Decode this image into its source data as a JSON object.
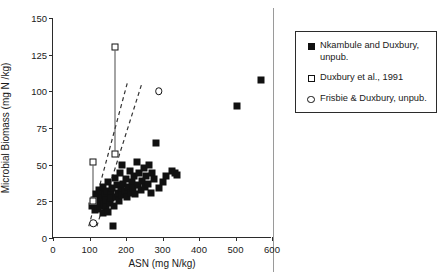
{
  "chart_data": {
    "type": "scatter",
    "title": "",
    "xlabel": "ASN (mg N/kg)",
    "ylabel": "Microbial Biomass (mg N /kg)",
    "xlim": [
      0,
      600
    ],
    "ylim": [
      0,
      150
    ],
    "xticks": [
      0,
      100,
      200,
      300,
      400,
      500,
      600
    ],
    "yticks": [
      0,
      25,
      50,
      75,
      100,
      125,
      150
    ],
    "grid": false,
    "legend_position": "right-outside",
    "series": [
      {
        "name": "Nkambule and Duxbury, unpub.",
        "marker": "filled-square",
        "color": "#111111",
        "points": [
          [
            108,
            22
          ],
          [
            112,
            26
          ],
          [
            115,
            19
          ],
          [
            118,
            30
          ],
          [
            120,
            24
          ],
          [
            122,
            28
          ],
          [
            124,
            20
          ],
          [
            126,
            33
          ],
          [
            128,
            25
          ],
          [
            130,
            22
          ],
          [
            132,
            31
          ],
          [
            134,
            27
          ],
          [
            136,
            17
          ],
          [
            138,
            35
          ],
          [
            140,
            23
          ],
          [
            142,
            29
          ],
          [
            144,
            21
          ],
          [
            146,
            26
          ],
          [
            148,
            32
          ],
          [
            150,
            18
          ],
          [
            152,
            38
          ],
          [
            155,
            24
          ],
          [
            158,
            30
          ],
          [
            160,
            27
          ],
          [
            163,
            34
          ],
          [
            165,
            8
          ],
          [
            168,
            22
          ],
          [
            170,
            41
          ],
          [
            172,
            28
          ],
          [
            175,
            36
          ],
          [
            178,
            31
          ],
          [
            180,
            25
          ],
          [
            183,
            44
          ],
          [
            186,
            33
          ],
          [
            188,
            29
          ],
          [
            190,
            50
          ],
          [
            193,
            37
          ],
          [
            196,
            32
          ],
          [
            200,
            40
          ],
          [
            203,
            28
          ],
          [
            206,
            35
          ],
          [
            210,
            46
          ],
          [
            213,
            31
          ],
          [
            216,
            38
          ],
          [
            220,
            34
          ],
          [
            223,
            42
          ],
          [
            226,
            30
          ],
          [
            230,
            52
          ],
          [
            233,
            36
          ],
          [
            236,
            44
          ],
          [
            240,
            33
          ],
          [
            244,
            39
          ],
          [
            248,
            48
          ],
          [
            252,
            35
          ],
          [
            256,
            42
          ],
          [
            260,
            37
          ],
          [
            264,
            50
          ],
          [
            268,
            31
          ],
          [
            272,
            44
          ],
          [
            276,
            40
          ],
          [
            282,
            65
          ],
          [
            290,
            34
          ],
          [
            300,
            38
          ],
          [
            310,
            42
          ],
          [
            325,
            46
          ],
          [
            335,
            44
          ],
          [
            340,
            43
          ],
          [
            505,
            90
          ],
          [
            570,
            108
          ]
        ]
      },
      {
        "name": "Duxbury et al., 1991",
        "marker": "open-square",
        "color": "#111111",
        "points": [
          [
            170,
            130
          ],
          [
            170,
            57
          ],
          [
            110,
            52
          ],
          [
            110,
            25
          ]
        ],
        "error_bars": [
          {
            "x": 170,
            "low": 57,
            "high": 130
          },
          {
            "x": 110,
            "low": 25,
            "high": 52
          }
        ]
      },
      {
        "name": "Frisbie & Duxbury, unpub.",
        "marker": "open-circle",
        "color": "#111111",
        "points": [
          [
            290,
            100
          ],
          [
            110,
            10
          ]
        ]
      }
    ],
    "trend_lines": [
      {
        "style": "dashed",
        "x1": 98,
        "y1": 8,
        "x2": 205,
        "y2": 107
      },
      {
        "style": "dashed",
        "x1": 120,
        "y1": 8,
        "x2": 243,
        "y2": 105
      }
    ]
  },
  "legend": {
    "entries": [
      {
        "marker": "filled-square",
        "label": "Nkambule and Duxbury, unpub."
      },
      {
        "marker": "open-square",
        "label": "Duxbury et al., 1991"
      },
      {
        "marker": "open-circle",
        "label": "Frisbie & Duxbury, unpub."
      }
    ]
  }
}
